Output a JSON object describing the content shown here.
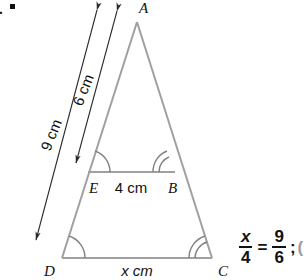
{
  "figure": {
    "kind": "geometry-diagram",
    "list_marker": ".",
    "stroke_color": "#a0a0a0",
    "dimension_color": "#2b2b2b",
    "text_color": "#111111",
    "vertices": [
      {
        "name": "A",
        "label": "A",
        "x": 137,
        "y": 22,
        "label_x": 139,
        "label_y": 13
      },
      {
        "name": "D",
        "label": "D",
        "x": 62,
        "y": 258,
        "label_x": 44,
        "label_y": 276
      },
      {
        "name": "C",
        "label": "C",
        "x": 212,
        "y": 258,
        "label_x": 218,
        "label_y": 276
      },
      {
        "name": "E",
        "label": "E",
        "x": 88,
        "y": 172,
        "label_x": 89,
        "label_y": 193
      },
      {
        "name": "B",
        "label": "B",
        "x": 175,
        "y": 172,
        "label_x": 168,
        "label_y": 193
      }
    ],
    "segments": [
      {
        "name": "side-AD",
        "from": "A",
        "to": "D"
      },
      {
        "name": "side-AC",
        "from": "A",
        "to": "C"
      },
      {
        "name": "base-DC",
        "from": "D",
        "to": "C"
      },
      {
        "name": "segment-EB",
        "from": "E",
        "to": "B"
      }
    ],
    "angle_marks": [
      {
        "at": "D",
        "arcs": 1
      },
      {
        "at": "C",
        "arcs": 2
      },
      {
        "at": "E",
        "arcs": 1
      },
      {
        "at": "B",
        "arcs": 2
      }
    ],
    "dimensions": [
      {
        "name": "dimension-9cm",
        "label": "9 cm",
        "value": 9,
        "unit": "cm",
        "measures": "A to D",
        "arrow": "double",
        "label_x": 56,
        "label_y": 137,
        "rotation": -68
      },
      {
        "name": "dimension-6cm",
        "label": "6 cm",
        "value": 6,
        "unit": "cm",
        "measures": "A to E",
        "arrow": "double",
        "label_x": 88,
        "label_y": 92,
        "rotation": -68
      },
      {
        "name": "dimension-4cm",
        "label": "4 cm",
        "value": 4,
        "unit": "cm",
        "measures": "E to B",
        "arrow": "none",
        "label_x": 131,
        "label_y": 193
      },
      {
        "name": "dimension-x-cm",
        "label": "x cm",
        "value": "x",
        "unit": "cm",
        "measures": "D to C",
        "arrow": "none",
        "label_x": 137,
        "label_y": 276
      }
    ]
  },
  "equation": {
    "name": "proportion-equation",
    "left": {
      "numerator": "x",
      "denominator": "4",
      "numerator_italic": true
    },
    "operator": "=",
    "right": {
      "numerator": "9",
      "denominator": "6",
      "numerator_italic": false
    },
    "terminator": ";",
    "cut_off_text": "("
  }
}
